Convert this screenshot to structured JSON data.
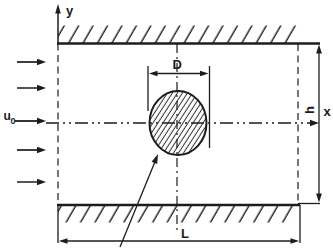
{
  "figure": {
    "background": "#ffffff",
    "ink_color": "#1c1c1c",
    "labels": {
      "y_axis": "y",
      "x_axis": "x",
      "cylinder_diameter": "D",
      "channel_length": "L",
      "channel_height": "h",
      "inlet_velocity_symbol": "u",
      "inlet_velocity_subscript": "0"
    }
  }
}
